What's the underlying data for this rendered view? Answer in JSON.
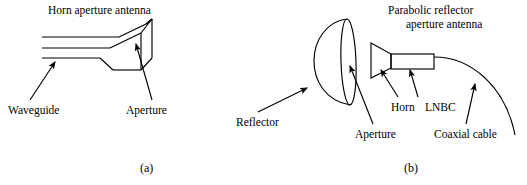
{
  "figure": {
    "width": 527,
    "height": 185,
    "background": "#ffffff",
    "stroke_color": "#000000"
  },
  "panel_a": {
    "caption": "(a)",
    "title": "Horn aperture antenna",
    "labels": {
      "waveguide": "Waveguide",
      "aperture": "Aperture"
    },
    "parts": [
      "waveguide",
      "flared horn",
      "rectangular aperture"
    ]
  },
  "panel_b": {
    "caption": "(b)",
    "title_line1": "Parabolic reflector",
    "title_line2": "aperture antenna",
    "labels": {
      "reflector": "Reflector",
      "aperture": "Aperture",
      "horn": "Horn",
      "lnbc": "LNBC",
      "coaxial_cable": "Coaxial cable"
    },
    "parts": [
      "parabolic dish reflector",
      "elliptical aperture rim",
      "feed horn",
      "LNBC block",
      "coaxial cable arc"
    ]
  }
}
